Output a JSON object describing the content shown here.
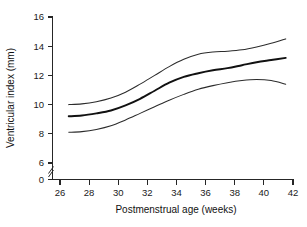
{
  "chart_data": {
    "type": "line",
    "title": "",
    "xlabel": "Postmenstrual age (weeks)",
    "ylabel": "Ventricular index (mm)",
    "xlim": [
      25.0,
      42.0
    ],
    "ylim": [
      0,
      16
    ],
    "y_axis_break": true,
    "y_break_between": [
      0,
      6
    ],
    "grid": false,
    "legend": null,
    "xticks": [
      26,
      28,
      30,
      32,
      34,
      36,
      38,
      40,
      42
    ],
    "xtick_labels": [
      "26",
      "28",
      "30",
      "32",
      "34",
      "36",
      "38",
      "40",
      "42"
    ],
    "yticks": [
      0,
      6,
      8,
      10,
      12,
      14,
      16
    ],
    "ytick_labels": [
      "0",
      "6",
      "8",
      "10",
      "12",
      "14",
      "16"
    ],
    "x": [
      26.6,
      27.5,
      28.5,
      29.5,
      30.5,
      31.5,
      32.5,
      33.5,
      34.5,
      35.5,
      36.5,
      37.5,
      38.5,
      39.5,
      40.5,
      41.5
    ],
    "series": [
      {
        "name": "upper centile",
        "style": "thin",
        "values": [
          10.0,
          10.05,
          10.2,
          10.45,
          10.85,
          11.4,
          12.0,
          12.6,
          13.1,
          13.45,
          13.6,
          13.65,
          13.75,
          13.95,
          14.2,
          14.5
        ]
      },
      {
        "name": "mean",
        "style": "thick",
        "values": [
          9.2,
          9.25,
          9.4,
          9.6,
          9.95,
          10.4,
          10.95,
          11.5,
          11.9,
          12.15,
          12.35,
          12.5,
          12.7,
          12.9,
          13.05,
          13.2
        ]
      },
      {
        "name": "lower centile",
        "style": "thin",
        "values": [
          8.1,
          8.15,
          8.3,
          8.55,
          8.95,
          9.4,
          9.85,
          10.3,
          10.7,
          11.05,
          11.3,
          11.5,
          11.65,
          11.72,
          11.65,
          11.4
        ]
      }
    ]
  },
  "figure": {
    "xaxis_title": "Postmenstrual age (weeks)",
    "yaxis_title": "Ventricular index (mm)"
  }
}
